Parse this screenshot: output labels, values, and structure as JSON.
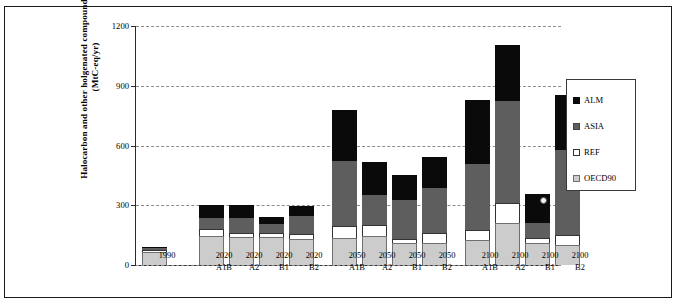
{
  "chart_data": {
    "type": "bar",
    "subtype": "stacked-bar",
    "title": "",
    "xlabel": "",
    "ylabel": "Halocarbon and other holgenated compounds emissions (MtC-eq/yr)",
    "ylim": [
      0,
      1200
    ],
    "yticks": [
      0,
      300,
      600,
      900,
      1200
    ],
    "ytick_labels": [
      "0",
      "300",
      "600",
      "900",
      "1200"
    ],
    "grid": true,
    "legend_position": "right",
    "categories": [
      "1990",
      "2020 A1B",
      "2020 A2",
      "2020 B1",
      "2020 B2",
      "2050 A1B",
      "2050 A2",
      "2050 B1",
      "2050 B2",
      "2100 A1B",
      "2100 A2",
      "2100 B1",
      "2100 B2"
    ],
    "category_lines": [
      [
        "1990",
        ""
      ],
      [
        "2020",
        "A1B"
      ],
      [
        "2020",
        "A2"
      ],
      [
        "2020",
        "B1"
      ],
      [
        "2020",
        "B2"
      ],
      [
        "2050",
        "A1B"
      ],
      [
        "2050",
        "A2"
      ],
      [
        "2050",
        "B1"
      ],
      [
        "2050",
        "B2"
      ],
      [
        "2100",
        "A1B"
      ],
      [
        "2100",
        "A2"
      ],
      [
        "2100",
        "B1"
      ],
      [
        "2100",
        "B2"
      ]
    ],
    "series": [
      {
        "name": "OECD90",
        "color": "#cccccc",
        "values": [
          65,
          145,
          140,
          140,
          130,
          135,
          145,
          110,
          110,
          125,
          210,
          110,
          100
        ]
      },
      {
        "name": "REF",
        "color": "#ffffff",
        "values": [
          10,
          35,
          20,
          20,
          25,
          60,
          55,
          20,
          50,
          50,
          100,
          25,
          50
        ]
      },
      {
        "name": "ASIA",
        "color": "#5e5e5e",
        "values": [
          10,
          55,
          75,
          45,
          90,
          325,
          150,
          195,
          225,
          330,
          515,
          75,
          430
        ]
      },
      {
        "name": "ALM",
        "color": "#0a0a0a",
        "values": [
          5,
          65,
          65,
          35,
          50,
          260,
          165,
          125,
          155,
          325,
          280,
          145,
          275
        ]
      }
    ],
    "totals": [
      90,
      300,
      300,
      240,
      295,
      780,
      515,
      450,
      540,
      830,
      1105,
      355,
      855
    ]
  },
  "legend": {
    "items": [
      {
        "label": "ALM",
        "swatch": "alm-swatch"
      },
      {
        "label": "ASIA",
        "swatch": "asia-swatch"
      },
      {
        "label": "REF",
        "swatch": "ref-swatch"
      },
      {
        "label": "OECD90",
        "swatch": "oecd90-swatch"
      }
    ]
  },
  "colors": {
    "alm": "#0a0a0a",
    "asia": "#5e5e5e",
    "ref": "#ffffff",
    "oecd90": "#cccccc",
    "grid": "#8d8d8d",
    "axis": "#2b2b2b",
    "frame": "#1a1a1a"
  }
}
